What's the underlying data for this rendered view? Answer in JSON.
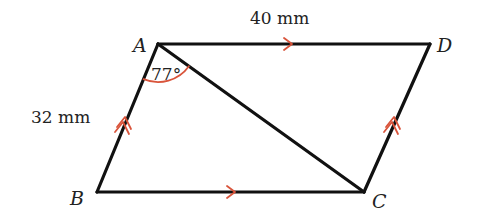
{
  "diagram": {
    "type": "parallelogram",
    "vertices": [
      {
        "name": "A",
        "label": "A"
      },
      {
        "name": "B",
        "label": "B"
      },
      {
        "name": "C",
        "label": "C"
      },
      {
        "name": "D",
        "label": "D"
      }
    ],
    "sides": {
      "AD": {
        "length_label": "40 mm",
        "parallel_mark": "single-arrow"
      },
      "BC": {
        "parallel_mark": "single-arrow"
      },
      "AB": {
        "length_label": "32 mm",
        "parallel_mark": "double-arrow"
      },
      "DC": {
        "parallel_mark": "double-arrow"
      }
    },
    "diagonal": "AC",
    "angle": {
      "at": "A",
      "between": "AB and AC",
      "label": "77°"
    },
    "colors": {
      "edges": "#111111",
      "marks": "#d9543b",
      "text": "#222222"
    }
  }
}
